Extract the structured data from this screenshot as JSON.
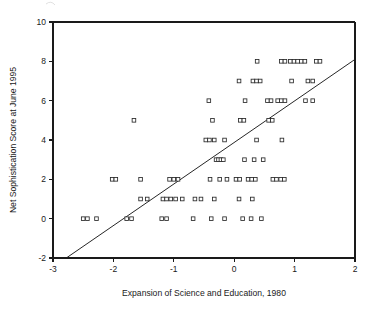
{
  "chart_data": {
    "type": "scatter",
    "title": "",
    "xlabel": "Expansion of Science and Education, 1980",
    "ylabel": "Net Sophistication Score at June 1995",
    "xlim": [
      -3,
      2
    ],
    "ylim": [
      -2,
      10
    ],
    "xticks": [
      -3,
      -2,
      -1,
      0,
      1,
      2
    ],
    "xtick_labels": [
      "-3",
      "-2",
      "-1",
      "0",
      "1",
      "2"
    ],
    "yticks": [
      -2,
      0,
      2,
      4,
      6,
      8,
      10
    ],
    "ytick_labels": [
      "-2",
      "0",
      "2",
      "4",
      "6",
      "8",
      "10"
    ],
    "grid": false,
    "legend": null,
    "marker": "open-square",
    "marker_color": "#2a2a2a",
    "marker_fill": "#ffffff",
    "line_color": "#1a1a1a",
    "trendline": {
      "label": "regression line",
      "x0": -2.78,
      "y0": -2.0,
      "x1": 2.0,
      "y1": 8.1,
      "slope": 2.113,
      "intercept": 3.87
    },
    "points": [
      [
        -2.5,
        0
      ],
      [
        -2.43,
        0
      ],
      [
        -2.28,
        0
      ],
      [
        -2.02,
        2
      ],
      [
        -1.96,
        2
      ],
      [
        -1.78,
        0
      ],
      [
        -1.7,
        0
      ],
      [
        -1.66,
        5
      ],
      [
        -1.55,
        2
      ],
      [
        -1.55,
        1
      ],
      [
        -1.44,
        1
      ],
      [
        -1.2,
        0
      ],
      [
        -1.12,
        0
      ],
      [
        -1.18,
        1
      ],
      [
        -1.12,
        1
      ],
      [
        -1.05,
        1
      ],
      [
        -0.97,
        1
      ],
      [
        -1.07,
        2
      ],
      [
        -1.0,
        2
      ],
      [
        -0.93,
        2
      ],
      [
        -0.86,
        1
      ],
      [
        -0.68,
        0
      ],
      [
        -0.65,
        1
      ],
      [
        -0.55,
        1
      ],
      [
        -0.47,
        4
      ],
      [
        -0.41,
        4
      ],
      [
        -0.42,
        6
      ],
      [
        -0.4,
        2
      ],
      [
        -0.38,
        0
      ],
      [
        -0.36,
        5
      ],
      [
        -0.33,
        4
      ],
      [
        -0.33,
        1
      ],
      [
        -0.3,
        3
      ],
      [
        -0.26,
        3
      ],
      [
        -0.22,
        3
      ],
      [
        -0.18,
        3
      ],
      [
        -0.24,
        2
      ],
      [
        -0.16,
        4
      ],
      [
        -0.16,
        0
      ],
      [
        -0.12,
        2
      ],
      [
        0.03,
        2
      ],
      [
        0.09,
        2
      ],
      [
        0.08,
        7
      ],
      [
        0.1,
        5
      ],
      [
        0.16,
        5
      ],
      [
        0.08,
        1
      ],
      [
        0.14,
        0
      ],
      [
        0.17,
        3
      ],
      [
        0.18,
        6
      ],
      [
        0.23,
        2
      ],
      [
        0.29,
        2
      ],
      [
        0.35,
        2
      ],
      [
        0.31,
        7
      ],
      [
        0.37,
        7
      ],
      [
        0.43,
        7
      ],
      [
        0.38,
        8
      ],
      [
        0.33,
        3
      ],
      [
        0.28,
        0
      ],
      [
        0.3,
        1
      ],
      [
        0.37,
        4
      ],
      [
        0.48,
        3
      ],
      [
        0.45,
        0
      ],
      [
        0.55,
        6
      ],
      [
        0.61,
        6
      ],
      [
        0.57,
        5
      ],
      [
        0.63,
        5
      ],
      [
        0.64,
        2
      ],
      [
        0.7,
        2
      ],
      [
        0.72,
        6
      ],
      [
        0.78,
        6
      ],
      [
        0.84,
        6
      ],
      [
        0.78,
        8
      ],
      [
        0.84,
        8
      ],
      [
        0.77,
        2
      ],
      [
        0.83,
        2
      ],
      [
        0.79,
        4
      ],
      [
        0.93,
        8
      ],
      [
        0.99,
        8
      ],
      [
        1.05,
        8
      ],
      [
        1.11,
        8
      ],
      [
        1.17,
        8
      ],
      [
        0.95,
        7
      ],
      [
        1.18,
        6
      ],
      [
        1.22,
        7
      ],
      [
        1.3,
        7
      ],
      [
        1.3,
        6
      ],
      [
        1.36,
        8
      ],
      [
        1.42,
        8
      ]
    ]
  },
  "annotations": {
    "artifact_top_left": "faint-scan-artifact"
  }
}
